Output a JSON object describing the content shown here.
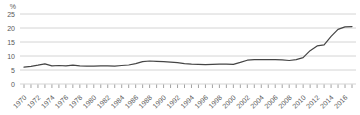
{
  "chart_data": {
    "type": "line",
    "title": "",
    "unit_label": "%",
    "xlabel": "",
    "ylabel": "%",
    "ylim": [
      0,
      25
    ],
    "grid": true,
    "legend": "none",
    "y_ticks": [
      0,
      5,
      10,
      15,
      20,
      25
    ],
    "x_tick_label_years": [
      1970,
      1972,
      1974,
      1976,
      1978,
      1980,
      1982,
      1984,
      1986,
      1988,
      1990,
      1992,
      1994,
      1996,
      1998,
      2000,
      2002,
      2004,
      2006,
      2008,
      2010,
      2012,
      2014,
      2016
    ],
    "x": [
      1970,
      1971,
      1972,
      1973,
      1974,
      1975,
      1976,
      1977,
      1978,
      1979,
      1980,
      1981,
      1982,
      1983,
      1984,
      1985,
      1986,
      1987,
      1988,
      1989,
      1990,
      1991,
      1992,
      1993,
      1994,
      1995,
      1996,
      1997,
      1998,
      1999,
      2000,
      2001,
      2002,
      2003,
      2004,
      2005,
      2006,
      2007,
      2008,
      2009,
      2010,
      2011,
      2012,
      2013,
      2014,
      2015,
      2016,
      2017
    ],
    "series": [
      {
        "name": "share-percent",
        "values": [
          6.0,
          6.3,
          6.7,
          7.2,
          6.5,
          6.6,
          6.5,
          6.7,
          6.5,
          6.4,
          6.4,
          6.5,
          6.5,
          6.4,
          6.6,
          6.8,
          7.3,
          8.0,
          8.2,
          8.1,
          8.0,
          7.8,
          7.6,
          7.3,
          7.1,
          7.0,
          6.9,
          7.0,
          7.1,
          7.1,
          7.0,
          7.7,
          8.5,
          8.7,
          8.7,
          8.7,
          8.7,
          8.6,
          8.4,
          8.7,
          9.4,
          11.9,
          13.6,
          14.0,
          17.0,
          19.5,
          20.4,
          20.5
        ]
      }
    ],
    "colors": {
      "line": "#454545",
      "grid": "#d4d4d4",
      "tick": "#8c8c8c",
      "label": "#595959",
      "background": "#ffffff"
    }
  }
}
